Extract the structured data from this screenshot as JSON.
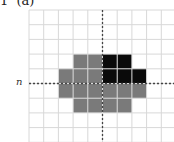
{
  "title": "1  (a)",
  "axis_label": "n",
  "colors": {
    "grid": "#d8d8d8",
    "gray": "#7a7a7a",
    "black": "#0a0a0a",
    "axis": "#444444"
  },
  "grid": {
    "x0": 29,
    "y0": 10,
    "cell": 14.7,
    "cols": 10,
    "rows": 9,
    "axis_col": 5,
    "axis_row": 5
  },
  "cells": [
    {
      "r": 3,
      "c": 3,
      "k": "gray"
    },
    {
      "r": 3,
      "c": 4,
      "k": "gray"
    },
    {
      "r": 3,
      "c": 5,
      "k": "black"
    },
    {
      "r": 3,
      "c": 6,
      "k": "black"
    },
    {
      "r": 4,
      "c": 2,
      "k": "gray"
    },
    {
      "r": 4,
      "c": 3,
      "k": "gray"
    },
    {
      "r": 4,
      "c": 4,
      "k": "gray"
    },
    {
      "r": 4,
      "c": 5,
      "k": "black"
    },
    {
      "r": 4,
      "c": 6,
      "k": "black"
    },
    {
      "r": 4,
      "c": 7,
      "k": "black"
    },
    {
      "r": 5,
      "c": 2,
      "k": "gray"
    },
    {
      "r": 5,
      "c": 3,
      "k": "gray"
    },
    {
      "r": 5,
      "c": 4,
      "k": "gray"
    },
    {
      "r": 5,
      "c": 5,
      "k": "gray"
    },
    {
      "r": 5,
      "c": 6,
      "k": "gray"
    },
    {
      "r": 5,
      "c": 7,
      "k": "gray"
    },
    {
      "r": 6,
      "c": 3,
      "k": "gray"
    },
    {
      "r": 6,
      "c": 4,
      "k": "gray"
    },
    {
      "r": 6,
      "c": 5,
      "k": "gray"
    },
    {
      "r": 6,
      "c": 6,
      "k": "gray"
    }
  ]
}
